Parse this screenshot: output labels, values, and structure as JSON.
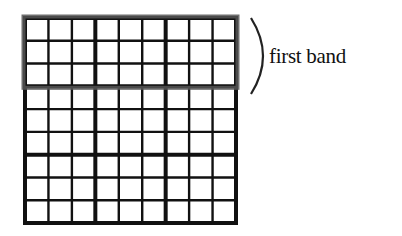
{
  "diagram": {
    "type": "sudoku-grid",
    "rows": 9,
    "cols": 9,
    "box_size": 3,
    "highlighted_band": {
      "index": 0,
      "label": "first band",
      "border_color": "#555555"
    },
    "line_color": "#111111",
    "background": "#ffffff"
  }
}
